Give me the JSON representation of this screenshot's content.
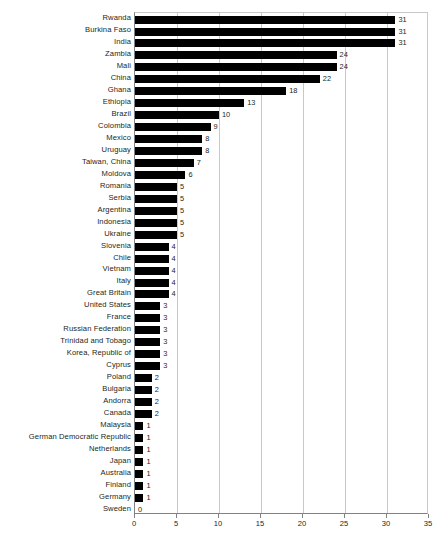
{
  "chart_data": {
    "type": "bar",
    "orientation": "horizontal",
    "title": "",
    "xlabel": "",
    "ylabel": "",
    "xlim": [
      0,
      35
    ],
    "xticks": [
      0,
      5,
      10,
      15,
      20,
      25,
      30,
      35
    ],
    "grid": true,
    "legend": false,
    "bar_color": "#000000",
    "gridline_color": "#c7c8ca",
    "axis_color": "#808285",
    "text_color": "#231f20",
    "show_value_labels": true,
    "categories": [
      "Rwanda",
      "Burkina Faso",
      "India",
      "Zambia",
      "Mali",
      "China",
      "Ghana",
      "Ethiopia",
      "Brazil",
      "Colombia",
      "Mexico",
      "Uruguay",
      "Taiwan, China",
      "Moldova",
      "Romania",
      "Serbia",
      "Argentina",
      "Indonesia",
      "Ukraine",
      "Slovenia",
      "Chile",
      "Vietnam",
      "Italy",
      "Great Britain",
      "United States",
      "France",
      "Russian Federation",
      "Trinidad and Tobago",
      "Korea, Republic of",
      "Cyprus",
      "Poland",
      "Bulgaria",
      "Andorra",
      "Canada",
      "Malaysia",
      "German Democratic Republic",
      "Netherlands",
      "Japan",
      "Australia",
      "Finland",
      "Germany",
      "Sweden"
    ],
    "values": [
      31,
      31,
      31,
      24,
      24,
      22,
      18,
      13,
      10,
      9,
      8,
      8,
      7,
      6,
      5,
      5,
      5,
      5,
      5,
      4,
      4,
      4,
      4,
      4,
      3,
      3,
      3,
      3,
      3,
      3,
      2,
      2,
      2,
      2,
      1,
      1,
      1,
      1,
      1,
      1,
      1,
      0
    ],
    "value_labels": [
      "31",
      "31",
      "31",
      "24",
      "24",
      "22",
      "18",
      "13",
      "10",
      "9",
      "8",
      "8",
      "7",
      "6",
      "5",
      "5",
      "5",
      "5",
      "5",
      "4",
      "4",
      "4",
      "4",
      "4",
      "3",
      "3",
      "3",
      "3",
      "3",
      "3",
      "2",
      "2",
      "2",
      "2",
      "1",
      "1",
      "1",
      "1",
      "1",
      "1",
      "1",
      "0"
    ]
  }
}
